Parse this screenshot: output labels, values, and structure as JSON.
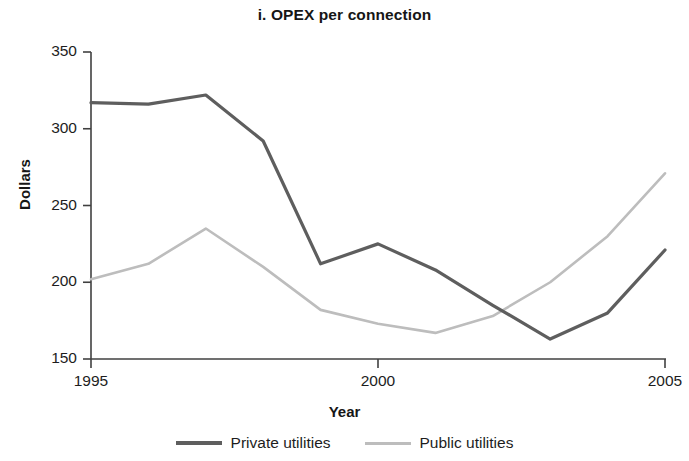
{
  "chart_data": {
    "type": "line",
    "title": "i. OPEX per connection",
    "xlabel": "Year",
    "ylabel": "Dollars",
    "x": [
      1995,
      1996,
      1997,
      1998,
      1999,
      2000,
      2001,
      2002,
      2003,
      2004,
      2005
    ],
    "xlim": [
      1995,
      2005
    ],
    "ylim": [
      150,
      350
    ],
    "xticks": [
      "1995",
      "2000",
      "2005"
    ],
    "xtick_values": [
      1995,
      2000,
      2005
    ],
    "yticks": [
      "150",
      "200",
      "250",
      "300",
      "350"
    ],
    "ytick_values": [
      150,
      200,
      250,
      300,
      350
    ],
    "grid": false,
    "legend_position": "bottom-center",
    "series": [
      {
        "name": "Private utilities",
        "color": "#5e5e5e",
        "line_width": 3.2,
        "values": [
          317,
          316,
          322,
          292,
          212,
          225,
          208,
          185,
          163,
          180,
          221
        ]
      },
      {
        "name": "Public utilities",
        "color": "#bdbdbd",
        "line_width": 2.6,
        "values": [
          202,
          212,
          235,
          210,
          182,
          173,
          167,
          178,
          200,
          230,
          271
        ]
      }
    ]
  },
  "axis": {
    "line_color": "#404040"
  },
  "legend": {
    "items": [
      {
        "label": "Private utilities",
        "color": "#5e5e5e"
      },
      {
        "label": "Public utilities",
        "color": "#bdbdbd"
      }
    ]
  }
}
